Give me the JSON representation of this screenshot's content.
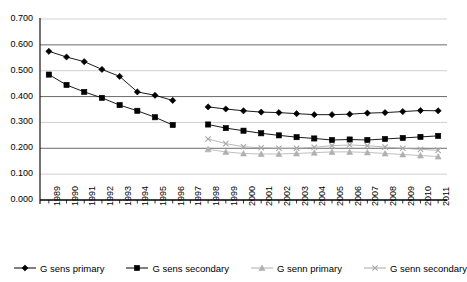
{
  "chart_data": {
    "type": "line",
    "title": "",
    "xlabel": "",
    "ylabel": "",
    "ylim": [
      0.0,
      0.7
    ],
    "ytick_labels": [
      "0.700",
      "0.600",
      "0.500",
      "0.400",
      "0.300",
      "0.200",
      "0.100",
      "0.000"
    ],
    "ytick_values": [
      0.7,
      0.6,
      0.5,
      0.4,
      0.3,
      0.2,
      0.1,
      0.0
    ],
    "grid": "horizontal",
    "legend_position": "bottom",
    "categories": [
      "1989",
      "1990",
      "1991",
      "1992",
      "1993",
      "1994",
      "1995",
      "1996",
      "1997",
      "1998",
      "1999",
      "2000",
      "2001",
      "2002",
      "2003",
      "2004",
      "2005",
      "2006",
      "2007",
      "2008",
      "2009",
      "2010",
      "2011"
    ],
    "x": [
      1989,
      1990,
      1991,
      1992,
      1993,
      1994,
      1995,
      1996,
      1997,
      1998,
      1999,
      2000,
      2001,
      2002,
      2003,
      2004,
      2005,
      2006,
      2007,
      2008,
      2009,
      2010,
      2011
    ],
    "series": [
      {
        "name": "G sens primary",
        "marker": "diamond",
        "color": "#000000",
        "values": [
          0.575,
          0.553,
          0.535,
          0.505,
          0.478,
          0.418,
          0.405,
          0.385,
          null,
          0.36,
          0.352,
          0.345,
          0.34,
          0.338,
          0.334,
          0.33,
          0.33,
          0.332,
          0.336,
          0.338,
          0.342,
          0.346,
          0.345
        ]
      },
      {
        "name": "G sens secondary",
        "marker": "square",
        "color": "#000000",
        "values": [
          0.485,
          0.445,
          0.418,
          0.395,
          0.367,
          0.345,
          0.32,
          0.29,
          null,
          0.292,
          0.278,
          0.268,
          0.258,
          0.25,
          0.243,
          0.238,
          0.232,
          0.234,
          0.232,
          0.236,
          0.24,
          0.244,
          0.248
        ]
      },
      {
        "name": "G senn primary",
        "marker": "triangle",
        "color": "#b0b0b0",
        "values": [
          null,
          null,
          null,
          null,
          null,
          null,
          null,
          null,
          null,
          0.196,
          0.186,
          0.18,
          0.178,
          0.178,
          0.18,
          0.183,
          0.186,
          0.186,
          0.184,
          0.18,
          0.176,
          0.172,
          0.168
        ]
      },
      {
        "name": "G senn secondary",
        "marker": "x",
        "color": "#a8a8a8",
        "values": [
          null,
          null,
          null,
          null,
          null,
          null,
          null,
          null,
          null,
          0.236,
          0.218,
          0.206,
          0.202,
          0.2,
          0.2,
          0.204,
          0.21,
          0.213,
          0.21,
          0.205,
          0.2,
          0.196,
          0.192
        ]
      }
    ]
  },
  "legend": {
    "items": [
      {
        "label": "G sens primary"
      },
      {
        "label": "G sens secondary"
      },
      {
        "label": "G senn primary"
      },
      {
        "label": "G senn secondary"
      }
    ]
  }
}
